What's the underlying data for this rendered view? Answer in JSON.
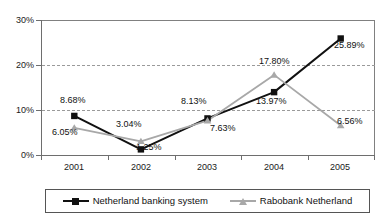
{
  "chart_data": {
    "type": "line",
    "title": "",
    "subtitle": "",
    "xlabel": "",
    "ylabel": "",
    "categories": [
      "2001",
      "2002",
      "2003",
      "2004",
      "2005"
    ],
    "x_tick_labels": [
      "2001",
      "2002",
      "2003",
      "2004",
      "2005"
    ],
    "y_tick_labels": [
      "30%",
      "20%",
      "10%",
      "0%"
    ],
    "y_tick_values": [
      30,
      20,
      10,
      0
    ],
    "ylim": [
      0,
      30
    ],
    "grid": "horizontal-dashed",
    "legend_position": "bottom",
    "series": [
      {
        "name": "Netherland banking system",
        "color": "#111111",
        "marker": "square",
        "values": [
          8.68,
          1.25,
          8.13,
          13.97,
          25.89
        ],
        "labels": [
          "8.68%",
          "1.25%",
          "8.13%",
          "13.97%",
          "25.89%"
        ]
      },
      {
        "name": "Rabobank Netherland",
        "color": "#a8a8a8",
        "marker": "triangle",
        "values": [
          6.05,
          3.04,
          7.63,
          17.8,
          6.56
        ],
        "labels": [
          "6.05%",
          "3.04%",
          "7.63%",
          "17.80%",
          "6.56%"
        ]
      }
    ],
    "data_labels": [
      "8.68%",
      "6.05%",
      "3.04%",
      "1.25%",
      "8.13%",
      "7.63%",
      "17.80%",
      "13.97%",
      "25.89%",
      "6.56%"
    ]
  },
  "legend": {
    "entries": [
      {
        "label": "Netherland banking system"
      },
      {
        "label": "Rabobank Netherland"
      }
    ]
  },
  "colors": {
    "series1": "#111111",
    "series2": "#a8a8a8",
    "axis": "#6e6e6e",
    "grid": "#9a9a9a",
    "background": "#ffffff"
  }
}
